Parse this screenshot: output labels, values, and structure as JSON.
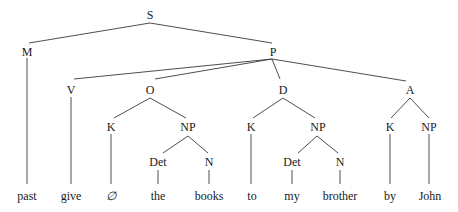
{
  "diagram": {
    "type": "syntax-tree",
    "nodes": {
      "S": "S",
      "M": "M",
      "P": "P",
      "V": "V",
      "O": "O",
      "D": "D",
      "A": "A",
      "O_K": "K",
      "O_NP": "NP",
      "D_K": "K",
      "D_NP": "NP",
      "A_K": "K",
      "A_NP": "NP",
      "O_Det": "Det",
      "O_N": "N",
      "D_Det": "Det",
      "D_N": "N"
    },
    "leaves": {
      "past": "past",
      "give": "give",
      "null": "∅",
      "the": "the",
      "books": "books",
      "to": "to",
      "my": "my",
      "brother": "brother",
      "by": "by",
      "John": "John"
    },
    "edges": [
      [
        "S",
        "M"
      ],
      [
        "S",
        "P"
      ],
      [
        "M",
        "past"
      ],
      [
        "P",
        "V"
      ],
      [
        "P",
        "O"
      ],
      [
        "P",
        "D"
      ],
      [
        "P",
        "A"
      ],
      [
        "V",
        "give"
      ],
      [
        "O",
        "O_K"
      ],
      [
        "O",
        "O_NP"
      ],
      [
        "O_K",
        "null"
      ],
      [
        "O_NP",
        "O_Det"
      ],
      [
        "O_NP",
        "O_N"
      ],
      [
        "O_Det",
        "the"
      ],
      [
        "O_N",
        "books"
      ],
      [
        "D",
        "D_K"
      ],
      [
        "D",
        "D_NP"
      ],
      [
        "D_K",
        "to"
      ],
      [
        "D_NP",
        "D_Det"
      ],
      [
        "D_NP",
        "D_N"
      ],
      [
        "D_Det",
        "my"
      ],
      [
        "D_N",
        "brother"
      ],
      [
        "A",
        "A_K"
      ],
      [
        "A",
        "A_NP"
      ],
      [
        "A_K",
        "by"
      ],
      [
        "A_NP",
        "John"
      ]
    ]
  }
}
